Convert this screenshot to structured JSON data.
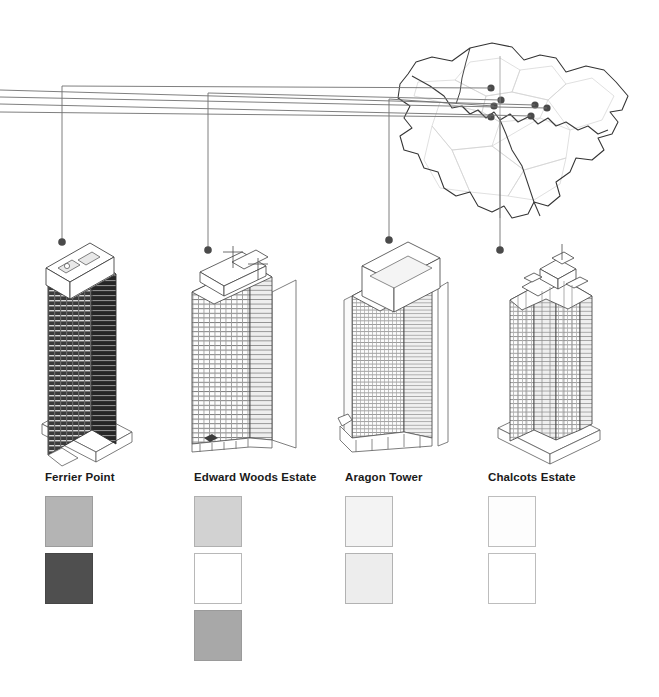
{
  "figure": {
    "type": "architectural-comparison-diagram",
    "background_color": "#ffffff",
    "line_color": "#555555",
    "dot_color": "#4a4a4a"
  },
  "map": {
    "name": "greater-london-boroughs-map",
    "outline_color": "#333333",
    "borough_line_color": "#cccccc",
    "river_color": "#444444",
    "site_dots": [
      {
        "id": "dot-1",
        "x": 491,
        "y": 88
      },
      {
        "id": "dot-2",
        "x": 501,
        "y": 100
      },
      {
        "id": "dot-3",
        "x": 494,
        "y": 106
      },
      {
        "id": "dot-4",
        "x": 491,
        "y": 117
      },
      {
        "id": "dot-5",
        "x": 535,
        "y": 105
      },
      {
        "id": "dot-6",
        "x": 547,
        "y": 108
      },
      {
        "id": "dot-7",
        "x": 531,
        "y": 116
      }
    ]
  },
  "leaders": [
    {
      "id": "leader-ferrier-point",
      "y": 88,
      "drop_x": 62,
      "drop_to_y": 242
    },
    {
      "id": "leader-edward-woods",
      "y": 95,
      "drop_x": 208,
      "drop_to_y": 250
    },
    {
      "id": "leader-aragon-tower",
      "y": 101,
      "drop_x": 389,
      "drop_to_y": 240
    },
    {
      "id": "leader-chalcots-estate",
      "y": 112,
      "drop_x": 500,
      "drop_to_y": 250
    }
  ],
  "towers": [
    {
      "id": "tower-ferrier-point",
      "name": "Ferrier Point",
      "facade_tone": "#3d3d3d",
      "side_tone": "#2b2b2b",
      "roof_tone": "#fbfbfb",
      "floors": 23,
      "bays": 7
    },
    {
      "id": "tower-edward-woods-estate",
      "name": "Edward Woods Estate",
      "facade_tone": "#f2f2f2",
      "side_tone": "#e0e0e0",
      "roof_tone": "#ffffff",
      "floors": 24,
      "bays": 9
    },
    {
      "id": "tower-aragon-tower",
      "name": "Aragon Tower",
      "facade_tone": "#fafafa",
      "side_tone": "#ededed",
      "roof_tone": "#ffffff",
      "floors": 29,
      "bays": 12
    },
    {
      "id": "tower-chalcots-estate",
      "name": "Chalcots Estate",
      "facade_tone": "#fbfbfb",
      "side_tone": "#ededed",
      "roof_tone": "#ffffff",
      "floors": 22,
      "bays": 6
    }
  ],
  "legend": {
    "columns": [
      {
        "id": "legend-ferrier-point",
        "label": "Ferrier Point",
        "left": 45,
        "swatches": [
          {
            "id": "swatch-ferrier-1",
            "fill": "#b4b4b4",
            "border": "#9c9c9c"
          },
          {
            "id": "swatch-ferrier-2",
            "fill": "#4f4f4f",
            "border": "#464646"
          }
        ]
      },
      {
        "id": "legend-edward-woods-estate",
        "label": "Edward Woods Estate",
        "left": 194,
        "swatches": [
          {
            "id": "swatch-edward-1",
            "fill": "#d2d2d2",
            "border": "#b0b0b0"
          },
          {
            "id": "swatch-edward-2",
            "fill": "#ffffff",
            "border": "#b8b8b8"
          },
          {
            "id": "swatch-edward-3",
            "fill": "#a8a8a8",
            "border": "#9a9a9a"
          }
        ]
      },
      {
        "id": "legend-aragon-tower",
        "label": "Aragon Tower",
        "left": 345,
        "swatches": [
          {
            "id": "swatch-aragon-1",
            "fill": "#f3f3f3",
            "border": "#b5b5b5"
          },
          {
            "id": "swatch-aragon-2",
            "fill": "#ededed",
            "border": "#b2b2b2"
          }
        ]
      },
      {
        "id": "legend-chalcots-estate",
        "label": "Chalcots Estate",
        "left": 488,
        "swatches": [
          {
            "id": "swatch-chalcots-1",
            "fill": "#fdfdfd",
            "border": "#bdbdbd"
          },
          {
            "id": "swatch-chalcots-2",
            "fill": "#ffffff",
            "border": "#bdbdbd"
          }
        ]
      }
    ]
  }
}
